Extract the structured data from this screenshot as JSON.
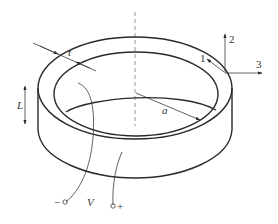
{
  "diagram": {
    "labels": {
      "thickness": "t",
      "radius": "a",
      "height": "L",
      "voltage": "V",
      "minus_terminal": "−",
      "plus_terminal": "+",
      "axis_1": "1",
      "axis_2": "2",
      "axis_3": "3"
    },
    "colors": {
      "line": "#2a2a2a",
      "centerline": "#8a8a8a",
      "background": "#ffffff"
    }
  }
}
